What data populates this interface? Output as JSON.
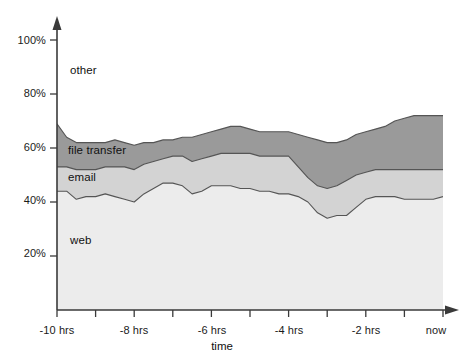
{
  "chart_data": {
    "type": "area",
    "stacked": true,
    "title": "",
    "subtitle": "",
    "xlabel": "time",
    "ylabel": "",
    "grid": false,
    "legend_position": "inline-labels",
    "xlim": [
      -10,
      0
    ],
    "ylim": [
      0,
      100
    ],
    "x_unit": "hrs",
    "x_tick_values": [
      -10,
      -9,
      -8,
      -7,
      -6,
      -5,
      -4,
      -3,
      -2,
      -1,
      0
    ],
    "x_tick_labels": [
      "-10 hrs",
      "",
      "-8 hrs",
      "",
      "-6 hrs",
      "",
      "-4 hrs",
      "",
      "-2 hrs",
      "",
      "now"
    ],
    "x_labeled_ticks": [
      {
        "value": -10,
        "label": "-10 hrs"
      },
      {
        "value": -8,
        "label": "-8 hrs"
      },
      {
        "value": -6,
        "label": "-6 hrs"
      },
      {
        "value": -4,
        "label": "-4 hrs"
      },
      {
        "value": -2,
        "label": "-2 hrs"
      },
      {
        "value": 0,
        "label": "now"
      }
    ],
    "y_tick_values": [
      20,
      40,
      60,
      80,
      100
    ],
    "y_tick_labels": [
      "20%",
      "40%",
      "60%",
      "80%",
      "100%"
    ],
    "x": [
      -10.0,
      -9.75,
      -9.5,
      -9.25,
      -9.0,
      -8.75,
      -8.5,
      -8.25,
      -8.0,
      -7.75,
      -7.5,
      -7.25,
      -7.0,
      -6.75,
      -6.5,
      -6.25,
      -6.0,
      -5.75,
      -5.5,
      -5.25,
      -5.0,
      -4.75,
      -4.5,
      -4.25,
      -4.0,
      -3.75,
      -3.5,
      -3.25,
      -3.0,
      -2.75,
      -2.5,
      -2.25,
      -2.0,
      -1.75,
      -1.5,
      -1.25,
      -1.0,
      -0.75,
      -0.5,
      -0.25,
      0.0
    ],
    "series": [
      {
        "name": "web",
        "color": "#ececec",
        "stack_order": 1,
        "cumulative_top": [
          44,
          44,
          41,
          42,
          42,
          43,
          42,
          41,
          40,
          43,
          45,
          47,
          47,
          46,
          43,
          44,
          46,
          46,
          46,
          45,
          45,
          44,
          44,
          43,
          43,
          42,
          40,
          36,
          34,
          35,
          35,
          38,
          41,
          42,
          42,
          42,
          41,
          41,
          41,
          41,
          42
        ],
        "values": [
          44,
          44,
          41,
          42,
          42,
          43,
          42,
          41,
          40,
          43,
          45,
          47,
          47,
          46,
          43,
          44,
          46,
          46,
          46,
          45,
          45,
          44,
          44,
          43,
          43,
          42,
          40,
          36,
          34,
          35,
          35,
          38,
          41,
          42,
          42,
          42,
          41,
          41,
          41,
          41,
          42
        ]
      },
      {
        "name": "email",
        "color": "#d3d3d3",
        "stack_order": 2,
        "cumulative_top": [
          53,
          53,
          52,
          52,
          52,
          53,
          53,
          53,
          52,
          54,
          55,
          56,
          57,
          57,
          55,
          56,
          57,
          58,
          58,
          58,
          58,
          57,
          57,
          57,
          57,
          53,
          49,
          46,
          45,
          46,
          48,
          50,
          51,
          52,
          52,
          52,
          52,
          52,
          52,
          52,
          52
        ],
        "values": [
          9,
          9,
          11,
          10,
          10,
          10,
          11,
          12,
          12,
          11,
          10,
          9,
          10,
          11,
          12,
          12,
          11,
          12,
          12,
          13,
          13,
          13,
          13,
          14,
          14,
          11,
          9,
          10,
          11,
          11,
          13,
          12,
          10,
          10,
          10,
          10,
          11,
          11,
          11,
          11,
          10
        ]
      },
      {
        "name": "file transfer",
        "color": "#9a9a9a",
        "stack_order": 3,
        "cumulative_top": [
          69,
          64,
          62,
          62,
          62,
          62,
          63,
          62,
          61,
          62,
          62,
          63,
          63,
          64,
          64,
          65,
          66,
          67,
          68,
          68,
          67,
          66,
          66,
          66,
          66,
          65,
          64,
          63,
          62,
          62,
          63,
          65,
          66,
          67,
          68,
          70,
          71,
          72,
          72,
          72,
          72
        ],
        "values": [
          25,
          11,
          10,
          10,
          10,
          9,
          10,
          9,
          9,
          8,
          7,
          7,
          6,
          7,
          9,
          9,
          9,
          9,
          10,
          10,
          9,
          9,
          9,
          9,
          9,
          12,
          15,
          17,
          17,
          16,
          15,
          15,
          15,
          15,
          16,
          18,
          19,
          20,
          20,
          20,
          20
        ]
      },
      {
        "name": "other",
        "color": "#ffffff",
        "stack_order": 4,
        "cumulative_top": [
          100,
          100,
          100,
          100,
          100,
          100,
          100,
          100,
          100,
          100,
          100,
          100,
          100,
          100,
          100,
          100,
          100,
          100,
          100,
          100,
          100,
          100,
          100,
          100,
          100,
          100,
          100,
          100,
          100,
          100,
          100,
          100,
          100,
          100,
          100,
          100,
          100,
          100,
          100,
          100,
          100
        ],
        "values": [
          31,
          36,
          38,
          38,
          38,
          38,
          37,
          38,
          39,
          38,
          38,
          37,
          37,
          36,
          36,
          35,
          34,
          33,
          32,
          32,
          33,
          34,
          34,
          34,
          34,
          35,
          36,
          37,
          38,
          38,
          37,
          35,
          34,
          33,
          32,
          30,
          29,
          28,
          28,
          28,
          28
        ]
      }
    ],
    "series_labels": [
      {
        "name": "other",
        "label": "other"
      },
      {
        "name": "file transfer",
        "label": "file transfer"
      },
      {
        "name": "email",
        "label": "email"
      },
      {
        "name": "web",
        "label": "web"
      }
    ],
    "axis_color": "#3a3a3a",
    "line_color": "#555555"
  }
}
